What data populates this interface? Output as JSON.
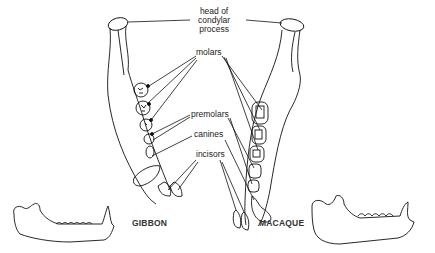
{
  "labels": {
    "condyle_line1": "head of",
    "condyle_line2": "condylar",
    "condyle_line3": "process",
    "molars": "molars",
    "premolars": "premolars",
    "canines": "canines",
    "incisors": "incisors"
  },
  "species": {
    "left": "GIBBON",
    "right": "MACAQUE"
  }
}
